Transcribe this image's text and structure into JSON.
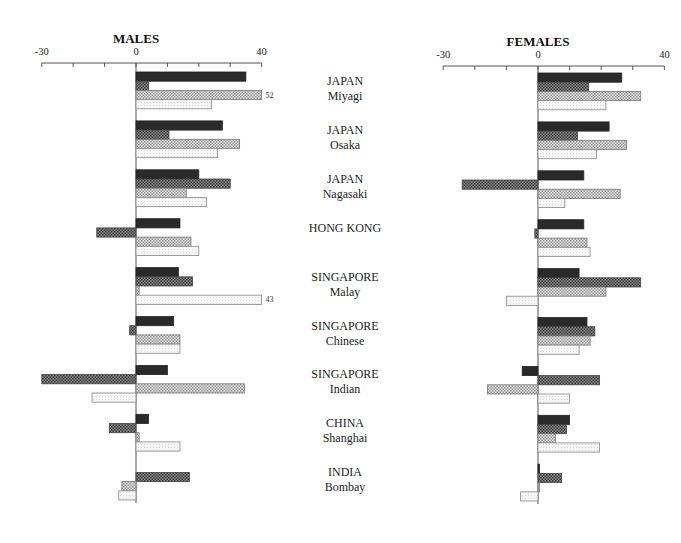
{
  "chart_data": [
    {
      "type": "bar",
      "orientation": "horizontal",
      "title": "MALES",
      "xlim": [
        -30,
        40
      ],
      "xticks": [
        -30,
        -20,
        -10,
        0,
        10,
        20,
        30,
        40
      ],
      "xtick_labels": [
        "-30",
        "0",
        "40"
      ],
      "grid": false,
      "categories": [
        [
          "JAPAN",
          "Miyagi"
        ],
        [
          "JAPAN",
          "Osaka"
        ],
        [
          "JAPAN",
          "Nagasaki"
        ],
        [
          "HONG KONG",
          ""
        ],
        [
          "SINGAPORE",
          "Malay"
        ],
        [
          "SINGAPORE",
          "Chinese"
        ],
        [
          "SINGAPORE",
          "Indian"
        ],
        [
          "CHINA",
          "Shanghai"
        ],
        [
          "INDIA",
          "Bombay"
        ]
      ],
      "series": [
        {
          "name": "series-1",
          "pattern": "solid-dark",
          "values": [
            35,
            27.5,
            20,
            14,
            13.5,
            12,
            10,
            4,
            0
          ]
        },
        {
          "name": "series-2",
          "pattern": "dark-crosshatch",
          "values": [
            4,
            10.5,
            30,
            -12.5,
            18,
            -2,
            -30,
            -8.5,
            17
          ]
        },
        {
          "name": "series-3",
          "pattern": "light-crosshatch",
          "values": [
            52,
            33,
            16,
            17.5,
            1,
            14,
            34.5,
            1,
            -4.5
          ]
        },
        {
          "name": "series-4",
          "pattern": "very-light",
          "values": [
            24,
            26,
            22.5,
            20,
            43,
            14,
            -14,
            14,
            -5.5
          ]
        }
      ],
      "annotations": [
        {
          "category": 0,
          "series": 2,
          "text": "52"
        },
        {
          "category": 4,
          "series": 3,
          "text": "43"
        }
      ]
    },
    {
      "type": "bar",
      "orientation": "horizontal",
      "title": "FEMALES",
      "xlim": [
        -30,
        40
      ],
      "xticks": [
        -30,
        -20,
        -10,
        0,
        10,
        20,
        30,
        40
      ],
      "xtick_labels": [
        "-30",
        "0",
        "40"
      ],
      "grid": false,
      "categories": [
        [
          "JAPAN",
          "Miyagi"
        ],
        [
          "JAPAN",
          "Osaka"
        ],
        [
          "JAPAN",
          "Nagasaki"
        ],
        [
          "HONG KONG",
          ""
        ],
        [
          "SINGAPORE",
          "Malay"
        ],
        [
          "SINGAPORE",
          "Chinese"
        ],
        [
          "SINGAPORE",
          "Indian"
        ],
        [
          "CHINA",
          "Shanghai"
        ],
        [
          "INDIA",
          "Bombay"
        ]
      ],
      "series": [
        {
          "name": "series-1",
          "pattern": "solid-dark",
          "values": [
            26.5,
            22.5,
            14.5,
            14.5,
            13,
            15.5,
            -5,
            10,
            0.5
          ]
        },
        {
          "name": "series-2",
          "pattern": "dark-crosshatch",
          "values": [
            16,
            12.5,
            -24,
            -1,
            32.5,
            18,
            19.5,
            9,
            7.5
          ]
        },
        {
          "name": "series-3",
          "pattern": "light-crosshatch",
          "values": [
            32.5,
            28,
            26,
            15.5,
            21.5,
            16.5,
            -16,
            5.5,
            0.5
          ]
        },
        {
          "name": "series-4",
          "pattern": "very-light",
          "values": [
            21.5,
            18.5,
            8.5,
            16.5,
            -10,
            13,
            10,
            19.5,
            -5.5
          ]
        }
      ],
      "annotations": []
    }
  ],
  "colors": {
    "solid-dark": "#2a2a2a",
    "dark-crosshatch": "#5e5e5e",
    "light-crosshatch": "#b8b8b8",
    "very-light": "#ececec"
  }
}
